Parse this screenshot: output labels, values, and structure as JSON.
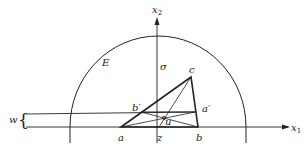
{
  "diagram": {
    "labels": {
      "x2": "x",
      "x2_sub": "2",
      "x1": "x",
      "x1_sub": "1",
      "E": "E",
      "sigma": "σ",
      "c": "c",
      "b_prime": "b′",
      "a_prime": "a′",
      "u": "u",
      "a": "a",
      "z": "z",
      "b": "b",
      "w": "w",
      "brace": "{"
    },
    "colors": {
      "stroke": "#222222",
      "background": "#ffffff"
    }
  }
}
